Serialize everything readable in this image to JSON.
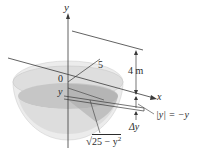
{
  "diagram": {
    "type": "hemispherical-tank-cross-section",
    "labels": {
      "y_axis": "y",
      "x_axis": "x",
      "origin": "0",
      "radius": "5",
      "depth_var": "y",
      "height": "4 m",
      "abs_y": "|y| = −y",
      "delta_y": "Δy",
      "sqrt_body": "25 − y",
      "sqrt_exp": "2"
    },
    "colors": {
      "bowl_outer": "#e6e6e6",
      "bowl_rim": "#d2d2d2",
      "liquid": "#c4c4c4",
      "liquid_dark": "#9e9e9e",
      "line": "#3a3a3a"
    }
  }
}
